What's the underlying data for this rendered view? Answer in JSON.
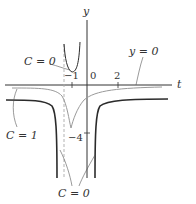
{
  "figure": {
    "axes": {
      "x_label": "t",
      "y_label": "y",
      "tick_labels": {
        "origin": "0",
        "t_neg1": "−1",
        "t_2": "2",
        "y_neg4": "−4"
      }
    },
    "annotations": {
      "c0_upper": "C = 0",
      "y0": "y = 0",
      "c1": "C = 1",
      "c0_lower": "C = 0"
    },
    "colors": {
      "axis": "#333333",
      "dark_curve": "#2b2b2b",
      "light_curve": "#9a9a9a",
      "dashed": "#aaaaaa"
    }
  }
}
